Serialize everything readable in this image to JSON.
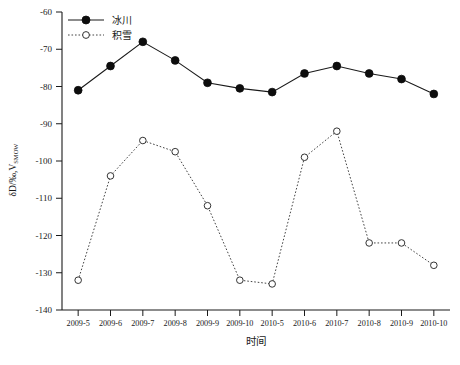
{
  "chart_data": {
    "type": "line",
    "title": "",
    "xlabel": "时间",
    "ylabel": "δD/‰, V-SMOW",
    "ylabel_main": "δD/‰,V",
    "ylabel_sub": "SMOW",
    "categories": [
      "2009-5",
      "2009-6",
      "2009-7",
      "2009-8",
      "2009-9",
      "2009-10",
      "2010-5",
      "2010-6",
      "2010-7",
      "2010-8",
      "2010-9",
      "2010-10"
    ],
    "ylim": [
      -140,
      -60
    ],
    "yticks": [
      -60,
      -70,
      -80,
      -90,
      -100,
      -110,
      -120,
      -130,
      -140
    ],
    "ytick_labels": [
      "-60",
      "-70",
      "-80",
      "-90",
      "-100",
      "-110",
      "-120",
      "-130",
      "-140"
    ],
    "grid": false,
    "legend_position": "top-left",
    "series": [
      {
        "name": "冰川",
        "marker": "filled-circle",
        "linestyle": "solid",
        "color": "#0d0d0d",
        "values": [
          -81.0,
          -74.5,
          -68.0,
          -73.0,
          -79.0,
          -80.5,
          -81.5,
          -76.5,
          -74.5,
          -76.5,
          -78.0,
          -82.0
        ]
      },
      {
        "name": "积雪",
        "marker": "open-circle",
        "linestyle": "dotted",
        "color": "#333333",
        "values": [
          -132.0,
          -104.0,
          -94.5,
          -97.5,
          -112.0,
          -132.0,
          -133.0,
          -99.0,
          -92.0,
          -122.0,
          -122.0,
          -128.0
        ]
      }
    ]
  },
  "legend": {
    "items": [
      {
        "label": "冰川"
      },
      {
        "label": "积雪"
      }
    ]
  },
  "axes": {
    "x_title": "时间",
    "y_title_main": "δD/‰,V",
    "y_title_sub": "SMOW"
  }
}
